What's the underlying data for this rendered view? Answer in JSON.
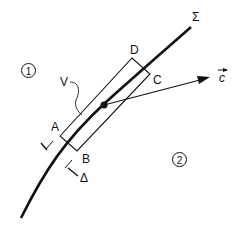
{
  "diagram": {
    "labels": {
      "sigma": "Σ",
      "A": "A",
      "B": "B",
      "C": "C",
      "D": "D",
      "V": "V",
      "delta": "Δ",
      "vector_c": "c",
      "region1": "1",
      "region2": "2"
    },
    "colors": {
      "ink": "#111111",
      "background": "#ffffff"
    }
  }
}
